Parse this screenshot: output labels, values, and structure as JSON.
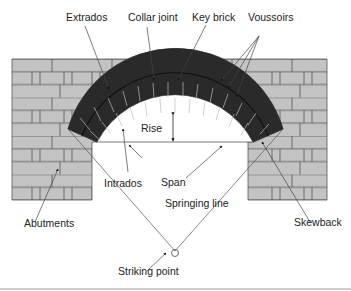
{
  "diagram": {
    "colors": {
      "brick": "#c3c3c3",
      "mortar": "#555555",
      "voussoir": "#2a2a2a",
      "line": "#333333",
      "background": "#ffffff"
    },
    "labels": {
      "extrados": "Extrados",
      "collar_joint": "Collar joint",
      "key_brick": "Key brick",
      "voussoirs": "Voussoirs",
      "rise": "Rise",
      "span": "Span",
      "intrados": "Intrados",
      "springing_line": "Springing line",
      "abutments": "Abutments",
      "skewback": "Skewback",
      "striking_point": "Striking point"
    }
  }
}
